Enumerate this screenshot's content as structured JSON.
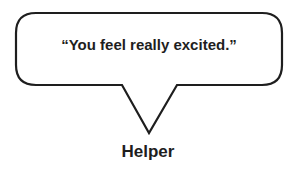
{
  "bubble": {
    "quote": "“You feel really excited.”",
    "stroke_color": "#1e1e1e",
    "fill_color": "#ffffff"
  },
  "speaker": {
    "label": "Helper"
  }
}
